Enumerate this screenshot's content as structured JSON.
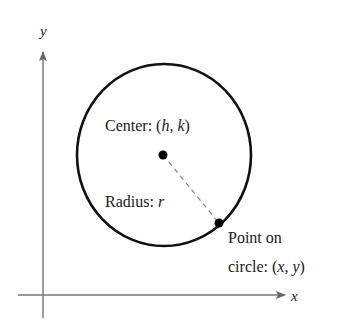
{
  "axes": {
    "x_label": "x",
    "y_label": "y",
    "axis_color": "#777777"
  },
  "circle": {
    "stroke_color": "#111111",
    "center_label_prefix": "Center: (",
    "center_h": "h",
    "center_sep": ", ",
    "center_k": "k",
    "center_suffix": ")",
    "radius_label_prefix": "Radius: ",
    "radius_var": "r",
    "point_label_line1": "Point on",
    "point_label_prefix": "circle: (",
    "point_x": "x",
    "point_sep": ", ",
    "point_y": "y",
    "point_suffix": ")"
  }
}
